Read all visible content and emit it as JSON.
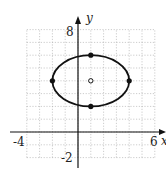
{
  "chart_data": {
    "type": "scatter",
    "title": "",
    "xlabel": "x",
    "ylabel": "y",
    "xlim": [
      -4,
      6
    ],
    "ylim": [
      -2,
      8
    ],
    "grid": true,
    "tick_labels": {
      "x_min": "-4",
      "x_max": "6",
      "y_min": "-2",
      "y_max": "8"
    },
    "ellipse": {
      "center": [
        1,
        4
      ],
      "a": 3,
      "b": 2,
      "orientation": "horizontal"
    },
    "points": [
      {
        "x": 1,
        "y": 6,
        "style": "filled",
        "role": "co-vertex"
      },
      {
        "x": 1,
        "y": 2,
        "style": "filled",
        "role": "co-vertex"
      },
      {
        "x": -2,
        "y": 4,
        "style": "filled",
        "role": "vertex"
      },
      {
        "x": 4,
        "y": 4,
        "style": "filled",
        "role": "vertex"
      },
      {
        "x": 1,
        "y": 4,
        "style": "open",
        "role": "center"
      }
    ]
  },
  "labels": {
    "x_axis": "x",
    "y_axis": "y",
    "x_min": "-4",
    "x_max": "6",
    "y_min": "-2",
    "y_max": "8"
  }
}
